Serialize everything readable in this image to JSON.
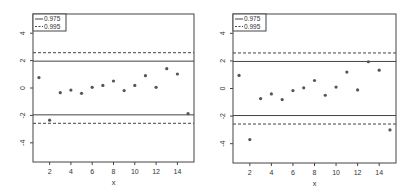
{
  "chart_data": [
    {
      "type": "scatter",
      "title": "",
      "xlabel": "x",
      "ylabel": "",
      "xlim": [
        0.44,
        15.56
      ],
      "ylim": [
        -5.4,
        5.4
      ],
      "xticks": [
        2,
        4,
        6,
        8,
        10,
        12,
        14
      ],
      "yticks": [
        -4,
        -2,
        0,
        2,
        4
      ],
      "grid": false,
      "legend_position": "top-left",
      "x": [
        1,
        2,
        3,
        4,
        5,
        6,
        7,
        8,
        9,
        10,
        11,
        12,
        13,
        14,
        15
      ],
      "y": [
        0.76,
        -2.35,
        -0.34,
        -0.15,
        -0.39,
        0.05,
        0.19,
        0.51,
        -0.19,
        0.19,
        0.9,
        0.05,
        1.41,
        1.02,
        -1.87
      ],
      "reference_lines": [
        {
          "name": "0.975",
          "style": "solid",
          "values": [
            1.96,
            -1.96
          ]
        },
        {
          "name": "0.995",
          "style": "dashed",
          "values": [
            2.576,
            -2.576
          ]
        }
      ],
      "legend": [
        "0.975",
        "0.995"
      ]
    },
    {
      "type": "scatter",
      "title": "",
      "xlabel": "x",
      "ylabel": "",
      "xlim": [
        0.44,
        15.56
      ],
      "ylim": [
        -5.4,
        5.4
      ],
      "xticks": [
        2,
        4,
        6,
        8,
        10,
        12,
        14
      ],
      "yticks": [
        -4,
        -2,
        0,
        2,
        4
      ],
      "grid": false,
      "legend_position": "top-left",
      "x": [
        1,
        2,
        3,
        4,
        5,
        6,
        7,
        8,
        9,
        10,
        11,
        12,
        13,
        14,
        15
      ],
      "y": [
        0.95,
        -3.7,
        -0.73,
        -0.39,
        -0.8,
        -0.15,
        0.05,
        0.58,
        -0.49,
        0.1,
        1.19,
        -0.1,
        1.94,
        1.33,
        -3.0
      ],
      "reference_lines": [
        {
          "name": "0.975",
          "style": "solid",
          "values": [
            1.96,
            -1.96
          ]
        },
        {
          "name": "0.995",
          "style": "dashed",
          "values": [
            2.576,
            -2.576
          ]
        }
      ],
      "legend": [
        "0.975",
        "0.995"
      ]
    }
  ],
  "panels": [
    {
      "frame": {
        "left": 33,
        "top": 14,
        "right": 194,
        "bottom": 162
      }
    },
    {
      "frame": {
        "left": 233,
        "top": 14,
        "right": 396,
        "bottom": 163
      }
    }
  ],
  "colors": {
    "axis": "#444444",
    "point": "#555555",
    "line": "#444444",
    "text": "#333333"
  }
}
